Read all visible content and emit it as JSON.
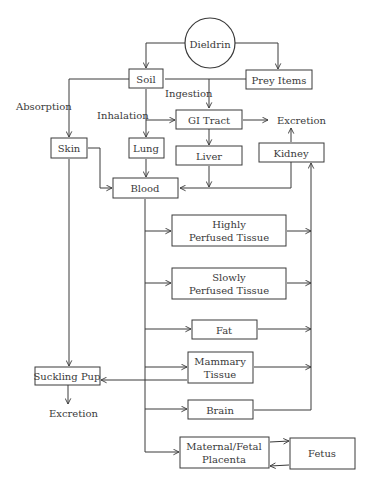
{
  "diagram": {
    "type": "flowchart",
    "title": "",
    "nodes": {
      "dieldrin": {
        "label": "Dieldrin",
        "shape": "circle"
      },
      "soil": {
        "label": "Soil"
      },
      "prey_items": {
        "label": "Prey Items"
      },
      "gi_tract": {
        "label": "GI Tract"
      },
      "skin": {
        "label": "Skin"
      },
      "lung": {
        "label": "Lung"
      },
      "liver": {
        "label": "Liver"
      },
      "kidney": {
        "label": "Kidney"
      },
      "blood": {
        "label": "Blood"
      },
      "highly_perfused": {
        "line1": "Highly",
        "line2": "Perfused Tissue"
      },
      "slowly_perfused": {
        "line1": "Slowly",
        "line2": "Perfused Tissue"
      },
      "fat": {
        "label": "Fat"
      },
      "mammary": {
        "line1": "Mammary",
        "line2": "Tissue"
      },
      "suckling_pup": {
        "label": "Suckling Pup"
      },
      "brain": {
        "label": "Brain"
      },
      "placenta": {
        "line1": "Maternal/Fetal",
        "line2": "Placenta"
      },
      "fetus": {
        "label": "Fetus"
      }
    },
    "edge_labels": {
      "absorption": "Absorption",
      "inhalation": "Inhalation",
      "ingestion": "Ingestion",
      "excretion_gi": "Excretion",
      "excretion_pup": "Excretion"
    },
    "edges": [
      {
        "from": "Dieldrin",
        "to": "Soil"
      },
      {
        "from": "Dieldrin",
        "to": "Prey Items"
      },
      {
        "from": "Soil",
        "to": "Skin",
        "label": "Absorption"
      },
      {
        "from": "Soil",
        "to": "Lung",
        "label": "Inhalation"
      },
      {
        "from": "Soil",
        "to": "GI Tract",
        "label": "Ingestion"
      },
      {
        "from": "Prey Items",
        "to": "GI Tract",
        "label": "Ingestion"
      },
      {
        "from": "GI Tract",
        "to": "Excretion"
      },
      {
        "from": "GI Tract",
        "to": "Liver"
      },
      {
        "from": "Liver",
        "to": "Blood"
      },
      {
        "from": "Kidney",
        "to": "Excretion"
      },
      {
        "from": "Kidney",
        "to": "Blood"
      },
      {
        "from": "Skin",
        "to": "Blood"
      },
      {
        "from": "Lung",
        "to": "Blood"
      },
      {
        "from": "Skin",
        "to": "Suckling Pup"
      },
      {
        "from": "Blood",
        "to": "Highly Perfused Tissue"
      },
      {
        "from": "Blood",
        "to": "Slowly Perfused Tissue"
      },
      {
        "from": "Blood",
        "to": "Fat"
      },
      {
        "from": "Blood",
        "to": "Mammary Tissue"
      },
      {
        "from": "Blood",
        "to": "Brain"
      },
      {
        "from": "Blood",
        "to": "Maternal/Fetal Placenta"
      },
      {
        "from": "Highly Perfused Tissue",
        "to": "Kidney"
      },
      {
        "from": "Slowly Perfused Tissue",
        "to": "Kidney"
      },
      {
        "from": "Fat",
        "to": "Kidney"
      },
      {
        "from": "Mammary Tissue",
        "to": "Kidney"
      },
      {
        "from": "Brain",
        "to": "Kidney"
      },
      {
        "from": "Mammary Tissue",
        "to": "Suckling Pup"
      },
      {
        "from": "Suckling Pup",
        "to": "Excretion"
      },
      {
        "from": "Maternal/Fetal Placenta",
        "to": "Fetus"
      },
      {
        "from": "Fetus",
        "to": "Maternal/Fetal Placenta"
      }
    ]
  },
  "colors": {
    "stroke": "#3a3a3a",
    "background": "#ffffff"
  }
}
